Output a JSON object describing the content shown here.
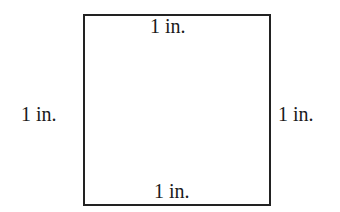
{
  "diagram": {
    "shape": "square",
    "side_labels": {
      "top": "1 in.",
      "bottom": "1 in.",
      "left": "1 in.",
      "right": "1 in."
    },
    "colors": {
      "stroke": "#222222",
      "background": "#ffffff",
      "text": "#1a1a1a"
    }
  }
}
